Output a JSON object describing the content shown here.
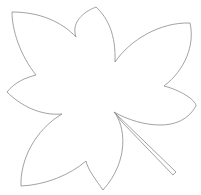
{
  "image": {
    "subject": "leaf outline drawing",
    "style": "line art",
    "stroke_color": "#8a8a8a",
    "background_color": "#ffffff",
    "lobes": 7,
    "has_stem": true
  },
  "watermark": {
    "text": ""
  }
}
